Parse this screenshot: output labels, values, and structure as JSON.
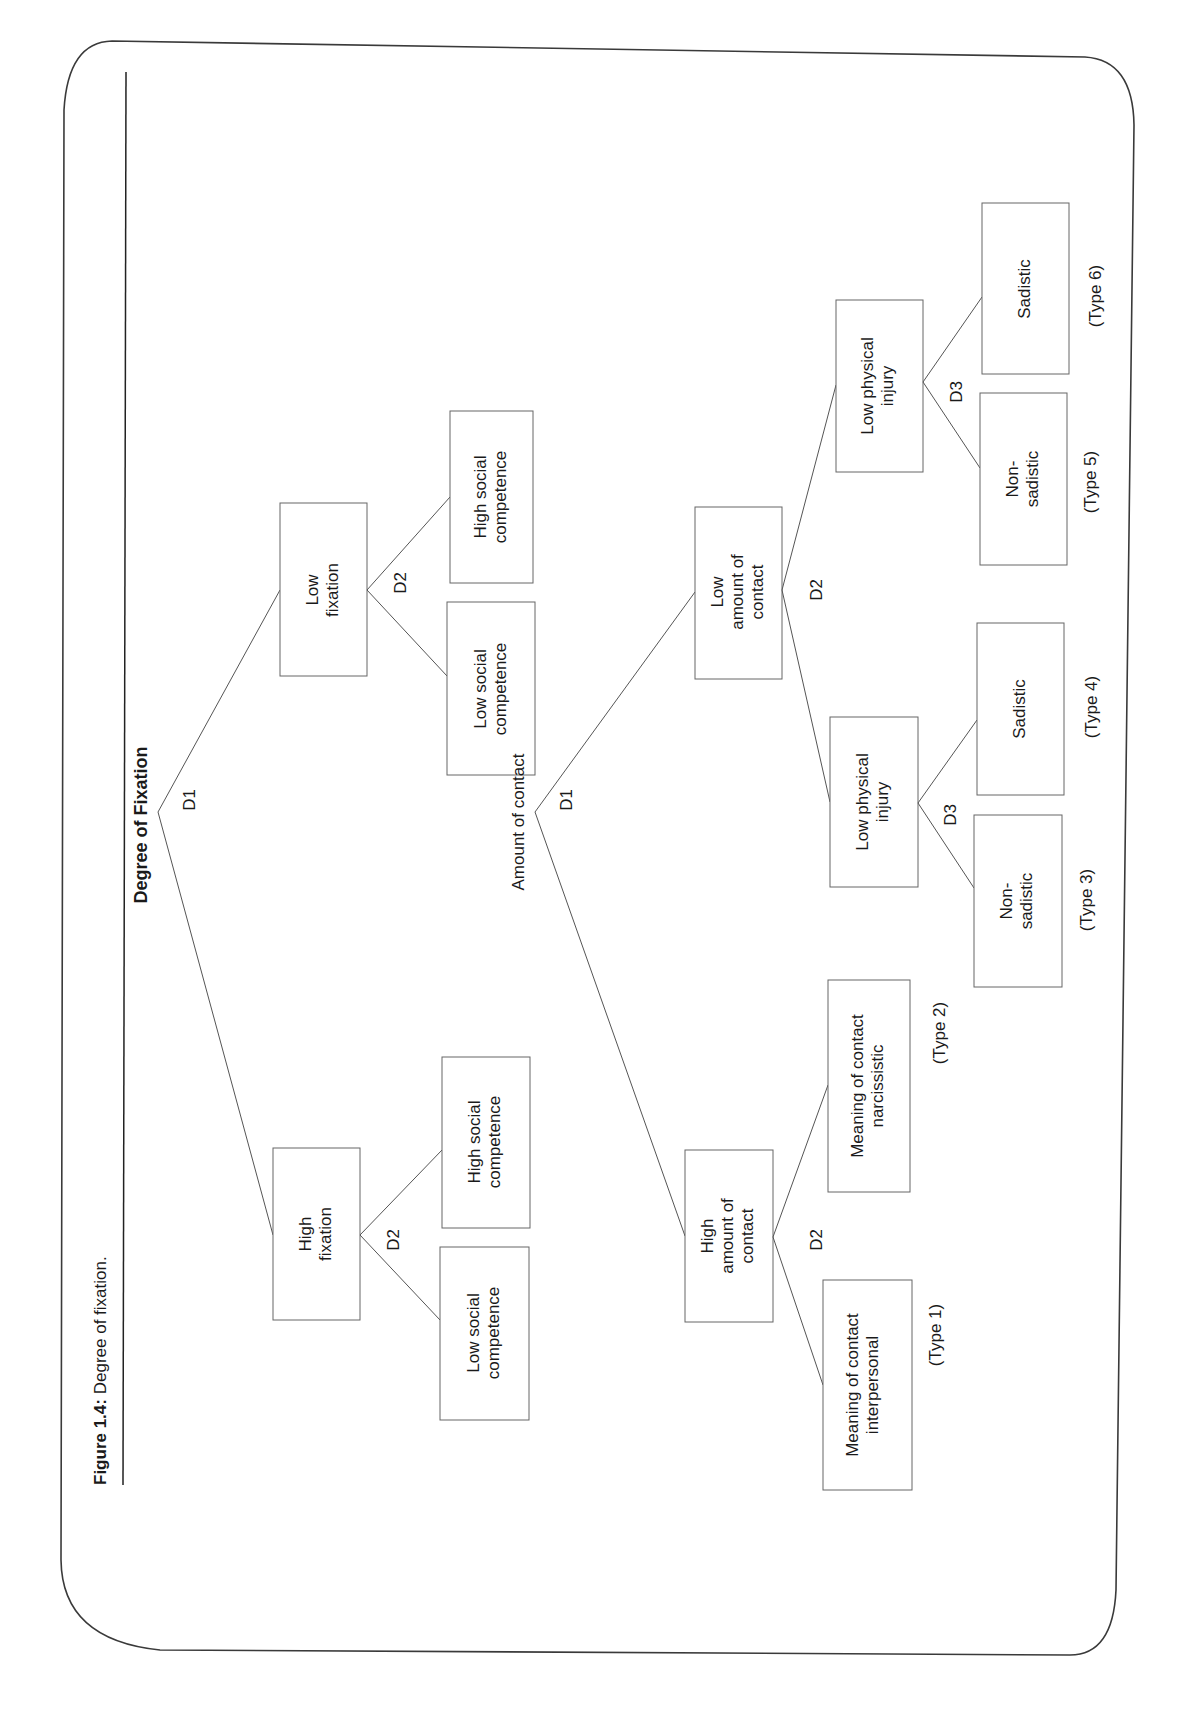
{
  "caption": {
    "label": "Figure 1.4:",
    "text": " Degree of fixation."
  },
  "tree1": {
    "title": "Degree of Fixation",
    "d1": "D1",
    "low_fixation": {
      "line1": "Low",
      "line2": "fixation",
      "d2": "D2",
      "high_social": {
        "line1": "High social",
        "line2": "competence"
      },
      "low_social": {
        "line1": "Low social",
        "line2": "competence"
      }
    },
    "high_fixation": {
      "line1": "High",
      "line2": "fixation",
      "d2": "D2",
      "high_social": {
        "line1": "High social",
        "line2": "competence"
      },
      "low_social": {
        "line1": "Low social",
        "line2": "competence"
      }
    }
  },
  "tree2": {
    "title": "Amount of contact",
    "d1": "D1",
    "high_contact": {
      "line1": "High",
      "line2": "amount of",
      "line3": "contact",
      "d2": "D2",
      "interpersonal": {
        "line1": "Meaning of contact",
        "line2": "interpersonal",
        "type": "(Type 1)"
      },
      "narcissistic": {
        "line1": "Meaning of contact",
        "line2": "narcissistic",
        "type": "(Type 2)"
      }
    },
    "low_contact": {
      "line1": "Low",
      "line2": "amount of",
      "line3": "contact",
      "d2": "D2",
      "injury_a": {
        "line1": "Low physical",
        "line2": "injury",
        "d3": "D3",
        "non_sadistic": {
          "line1": "Non-",
          "line2": "sadistic",
          "type": "(Type 3)"
        },
        "sadistic": {
          "line1": "Sadistic",
          "type": "(Type 4)"
        }
      },
      "injury_b": {
        "line1": "Low physical",
        "line2": "injury",
        "d3": "D3",
        "non_sadistic": {
          "line1": "Non-",
          "line2": "sadistic",
          "type": "(Type 5)"
        },
        "sadistic": {
          "line1": "Sadistic",
          "type": "(Type 6)"
        }
      }
    }
  }
}
